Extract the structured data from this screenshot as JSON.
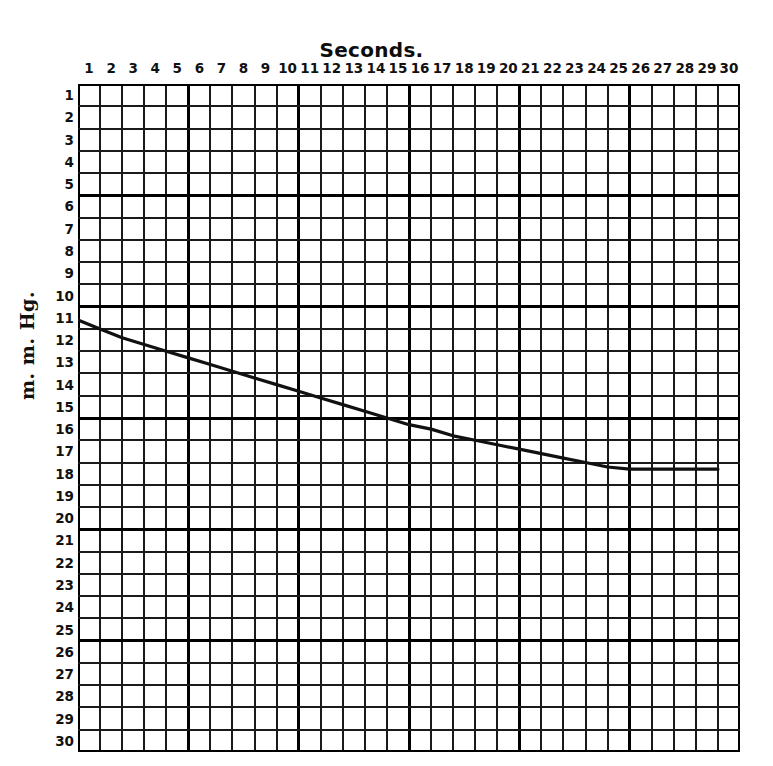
{
  "chart_data": {
    "type": "line",
    "title": "Seconds.",
    "xlabel": "Seconds.",
    "ylabel": "m. m. Hg.",
    "xlim": [
      0,
      30
    ],
    "ylim": [
      0,
      30
    ],
    "y_inverted": true,
    "grid": true,
    "legend": null,
    "x_ticks": [
      1,
      2,
      3,
      4,
      5,
      6,
      7,
      8,
      9,
      10,
      11,
      12,
      13,
      14,
      15,
      16,
      17,
      18,
      19,
      20,
      21,
      22,
      23,
      24,
      25,
      26,
      27,
      28,
      29,
      30
    ],
    "y_ticks": [
      1,
      2,
      3,
      4,
      5,
      6,
      7,
      8,
      9,
      10,
      11,
      12,
      13,
      14,
      15,
      16,
      17,
      18,
      19,
      20,
      21,
      22,
      23,
      24,
      25,
      26,
      27,
      28,
      29,
      30
    ],
    "x_tick_labels": [
      "1",
      "2",
      "3",
      "4",
      "5",
      "6",
      "7",
      "8",
      "9",
      "10",
      "11",
      "12",
      "13",
      "14",
      "15",
      "16",
      "17",
      "18",
      "19",
      "20",
      "21",
      "22",
      "23",
      "24",
      "25",
      "26",
      "27",
      "28",
      "29",
      "30"
    ],
    "y_tick_labels": [
      "1",
      "2",
      "3",
      "4",
      "5",
      "6",
      "7",
      "8",
      "9",
      "10",
      "11",
      "12",
      "13",
      "14",
      "15",
      "16",
      "17",
      "18",
      "19",
      "20",
      "21",
      "22",
      "23",
      "24",
      "25",
      "26",
      "27",
      "28",
      "29",
      "30"
    ],
    "series": [
      {
        "name": "pressure-decay",
        "color": "#111111",
        "x": [
          1,
          2,
          3,
          4,
          5,
          6,
          7,
          8,
          9,
          10,
          11,
          12,
          13,
          14,
          15,
          16,
          17,
          18,
          19,
          20,
          21,
          22,
          23,
          24,
          25,
          26,
          27,
          28,
          29,
          30
        ],
        "y": [
          11.6,
          12.0,
          12.4,
          12.7,
          13.0,
          13.3,
          13.6,
          13.9,
          14.2,
          14.5,
          14.8,
          15.1,
          15.4,
          15.7,
          16.0,
          16.3,
          16.5,
          16.8,
          17.0,
          17.2,
          17.4,
          17.6,
          17.8,
          18.0,
          18.2,
          18.3,
          18.3,
          18.3,
          18.3,
          18.3
        ]
      }
    ]
  },
  "axes": {
    "title": "Seconds.",
    "y_title": "m. m. Hg."
  },
  "style": {
    "background": "#ffffff",
    "ink": "#111111",
    "grid_minor": "#1a1a1a",
    "grid_major": "#000000"
  }
}
